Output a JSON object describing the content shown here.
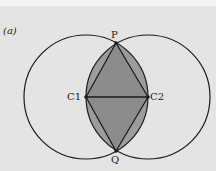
{
  "figure": {
    "panel_label": "(a)",
    "points": {
      "P": {
        "label": "P",
        "x": 116,
        "y": 43
      },
      "Q": {
        "label": "Q",
        "x": 116,
        "y": 151
      },
      "C1": {
        "label": "C1",
        "x": 86,
        "y": 97
      },
      "C2": {
        "label": "C2",
        "x": 148,
        "y": 97
      }
    },
    "circle_radius": 62,
    "colors": {
      "background": "#e4e4e2",
      "lens_fill": "#9c9c9c",
      "rhombus_fill": "#8c8c8c",
      "stroke": "#1a1a1a"
    }
  }
}
